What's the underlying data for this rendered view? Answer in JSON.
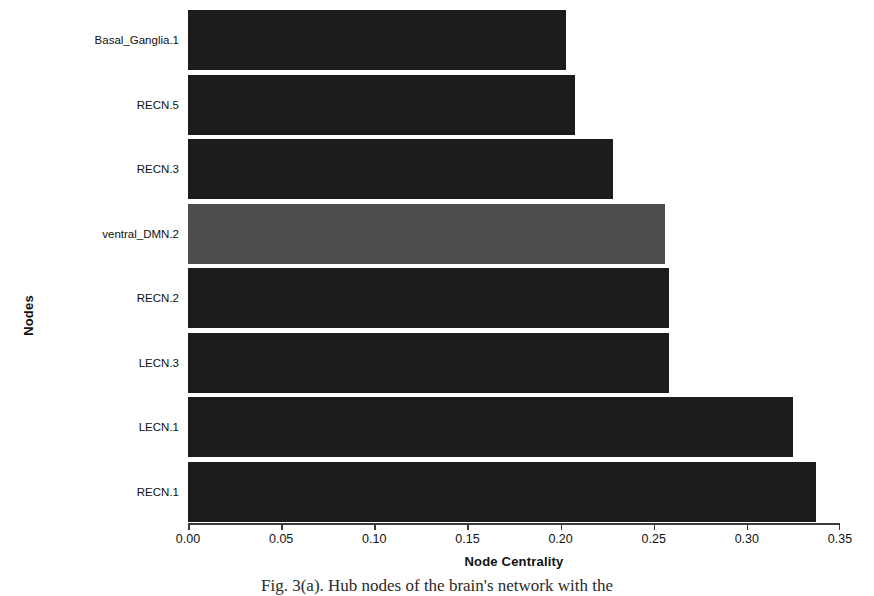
{
  "chart_data": {
    "type": "bar",
    "orientation": "horizontal",
    "title": "",
    "xlabel": "Node Centrality",
    "ylabel": "Nodes",
    "categories": [
      "Basal_Ganglia.1",
      "RECN.5",
      "RECN.3",
      "ventral_DMN.2",
      "RECN.2",
      "LECN.3",
      "LECN.1",
      "RECN.1"
    ],
    "values": [
      0.203,
      0.208,
      0.228,
      0.256,
      0.258,
      0.258,
      0.325,
      0.337
    ],
    "bar_colors": [
      "#1c1c1c",
      "#1c1c1c",
      "#1c1c1c",
      "#4d4d4d",
      "#1c1c1c",
      "#1c1c1c",
      "#1c1c1c",
      "#1c1c1c"
    ],
    "highlighted_category": "ventral_DMN.2",
    "xlim": [
      0.0,
      0.35
    ],
    "xticks": [
      0.0,
      0.05,
      0.1,
      0.15,
      0.2,
      0.25,
      0.3,
      0.35
    ],
    "xticklabels": [
      "0.00",
      "0.05",
      "0.10",
      "0.15",
      "0.20",
      "0.25",
      "0.30",
      "0.35"
    ],
    "grid": false,
    "legend": false
  },
  "caption": "Fig. 3(a).  Hub nodes of the brain's network with the"
}
